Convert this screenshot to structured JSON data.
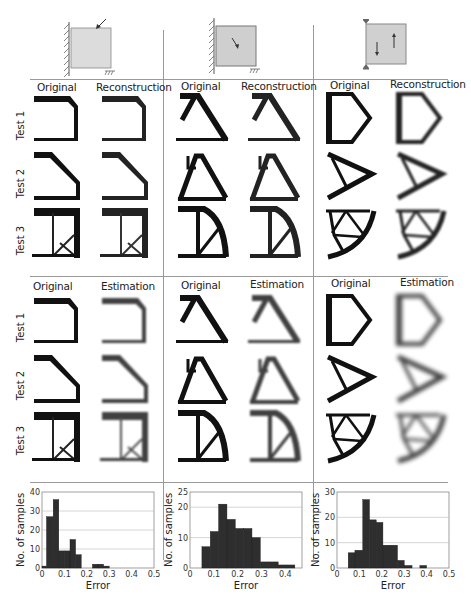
{
  "figure": {
    "columns": [
      {
        "id": "c1",
        "diagram": "cantilever-corner-load"
      },
      {
        "id": "c2",
        "diagram": "cantilever-interior-load"
      },
      {
        "id": "c3",
        "diagram": "two-supports-opposite-loads"
      }
    ],
    "top_block": {
      "headers": [
        [
          "Original",
          "Reconstruction"
        ],
        [
          "Original",
          "Reconstruction"
        ],
        [
          "Original",
          "Reconstruction"
        ]
      ],
      "row_labels": [
        "Test 1",
        "Test 2",
        "Test 3"
      ]
    },
    "bottom_block": {
      "headers": [
        [
          "Original",
          "Estimation"
        ],
        [
          "Original",
          "Estimation"
        ],
        [
          "Original",
          "Estimation"
        ]
      ],
      "row_labels": [
        "Test 1",
        "Test 2",
        "Test 3"
      ]
    }
  },
  "chart_data": [
    {
      "type": "bar",
      "title": "",
      "xlabel": "Error",
      "ylabel": "No. of samples",
      "xlim": [
        0,
        0.5
      ],
      "ylim": [
        0,
        40
      ],
      "xticks": [
        "0",
        "0.1",
        "0.2",
        "0.3",
        "0.4",
        "0.5"
      ],
      "yticks": [
        "0",
        "10",
        "20",
        "30",
        "40"
      ],
      "grid": true,
      "bins": [
        [
          0.0,
          0.02
        ],
        [
          0.02,
          0.05
        ],
        [
          0.05,
          0.075
        ],
        [
          0.075,
          0.1
        ],
        [
          0.1,
          0.125
        ],
        [
          0.125,
          0.15
        ],
        [
          0.15,
          0.175
        ],
        [
          0.175,
          0.2
        ],
        [
          0.2,
          0.225
        ],
        [
          0.225,
          0.25
        ],
        [
          0.25,
          0.275
        ],
        [
          0.275,
          0.3
        ]
      ],
      "values": [
        1,
        27,
        36,
        9,
        9,
        15,
        7,
        0,
        0,
        2,
        2,
        1
      ]
    },
    {
      "type": "bar",
      "title": "",
      "xlabel": "Error",
      "ylabel": "No. of samples",
      "xlim": [
        0,
        0.47
      ],
      "ylim": [
        0,
        25
      ],
      "xticks": [
        "0",
        "0.1",
        "0.2",
        "0.3",
        "0.4"
      ],
      "yticks": [
        "0",
        "10",
        "20",
        "25"
      ],
      "grid": true,
      "bins": [
        [
          0.05,
          0.085
        ],
        [
          0.085,
          0.12
        ],
        [
          0.12,
          0.155
        ],
        [
          0.155,
          0.19
        ],
        [
          0.19,
          0.225
        ],
        [
          0.225,
          0.26
        ],
        [
          0.26,
          0.295
        ],
        [
          0.295,
          0.33
        ],
        [
          0.33,
          0.37
        ],
        [
          0.37,
          0.405
        ],
        [
          0.405,
          0.44
        ]
      ],
      "values": [
        7,
        12,
        21,
        16,
        13,
        13,
        10,
        2,
        2,
        1,
        1
      ]
    },
    {
      "type": "bar",
      "title": "",
      "xlabel": "Error",
      "ylabel": "No. of samples",
      "xlim": [
        0,
        0.5
      ],
      "ylim": [
        0,
        30
      ],
      "xticks": [
        "0",
        "0.1",
        "0.2",
        "0.3",
        "0.4",
        "0.5"
      ],
      "yticks": [
        "0",
        "10",
        "20",
        "30"
      ],
      "grid": true,
      "bins": [
        [
          0.05,
          0.08
        ],
        [
          0.08,
          0.115
        ],
        [
          0.115,
          0.145
        ],
        [
          0.145,
          0.175
        ],
        [
          0.175,
          0.205
        ],
        [
          0.205,
          0.24
        ],
        [
          0.24,
          0.27
        ],
        [
          0.27,
          0.3
        ],
        [
          0.3,
          0.335
        ],
        [
          0.335,
          0.37
        ],
        [
          0.37,
          0.4
        ]
      ],
      "values": [
        6,
        7,
        27,
        19,
        18,
        9,
        9,
        3,
        1,
        0,
        1
      ]
    }
  ]
}
